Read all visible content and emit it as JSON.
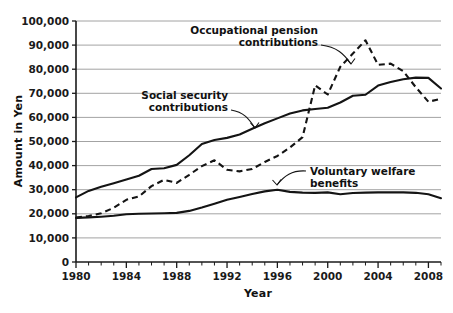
{
  "chart_data": {
    "type": "line",
    "title": "",
    "xlabel": "Year",
    "ylabel": "Amount in Yen",
    "xlim": [
      1980,
      2009
    ],
    "ylim": [
      0,
      100000
    ],
    "grid": true,
    "legend_position": "inline-annotations",
    "x_tick_labels": [
      "1980",
      "1984",
      "1988",
      "1992",
      "1996",
      "2000",
      "2004",
      "2008"
    ],
    "x_tick_values": [
      1980,
      1984,
      1988,
      1992,
      1996,
      2000,
      2004,
      2008
    ],
    "x_minor_tick_step": 1,
    "y_tick_labels": [
      "0",
      "10,000",
      "20,000",
      "30,000",
      "40,000",
      "50,000",
      "60,000",
      "70,000",
      "80,000",
      "90,000",
      "100,000"
    ],
    "y_tick_values": [
      0,
      10000,
      20000,
      30000,
      40000,
      50000,
      60000,
      70000,
      80000,
      90000,
      100000
    ],
    "x": [
      1980,
      1981,
      1982,
      1983,
      1984,
      1985,
      1986,
      1987,
      1988,
      1989,
      1990,
      1991,
      1992,
      1993,
      1994,
      1995,
      1996,
      1997,
      1998,
      1999,
      2000,
      2001,
      2002,
      2003,
      2004,
      2005,
      2006,
      2007,
      2008,
      2009
    ],
    "series": [
      {
        "name": "Social security contributions",
        "style": "solid",
        "color": "#141414",
        "values": [
          26800,
          29500,
          31200,
          32700,
          34200,
          35800,
          38600,
          38900,
          40300,
          44300,
          49000,
          50600,
          51500,
          52900,
          55300,
          57600,
          59600,
          61600,
          62900,
          63500,
          64000,
          66200,
          69000,
          69400,
          73200,
          74700,
          75800,
          76500,
          76400,
          72000
        ]
      },
      {
        "name": "Occupational pension contributions",
        "style": "dashed",
        "color": "#141414",
        "values": [
          18400,
          19100,
          20200,
          22500,
          25800,
          27200,
          31500,
          34100,
          32800,
          36200,
          39800,
          42200,
          38300,
          37600,
          38600,
          41500,
          44000,
          47500,
          51800,
          73300,
          69500,
          81000,
          86500,
          92000,
          81800,
          82300,
          79200,
          72500,
          66500,
          67700
        ]
      },
      {
        "name": "Voluntary welfare benefits",
        "style": "solid",
        "color": "#3a3a3a",
        "values": [
          18300,
          18500,
          18800,
          19200,
          19800,
          20000,
          20100,
          20200,
          20400,
          21200,
          22600,
          24200,
          25800,
          27000,
          28200,
          29300,
          30000,
          29100,
          28800,
          28700,
          28900,
          28100,
          28600,
          28800,
          28900,
          28900,
          28900,
          28700,
          28100,
          26500
        ]
      }
    ],
    "annotations": [
      {
        "id": "occupational-pension-label",
        "lines": [
          "Occupational pension",
          "contributions"
        ],
        "points_to": {
          "x": 2001,
          "y": 81000
        }
      },
      {
        "id": "social-security-label",
        "lines": [
          "Social security",
          "contributions"
        ],
        "points_to": {
          "x": 1994,
          "y": 55300
        }
      },
      {
        "id": "voluntary-welfare-label",
        "lines": [
          "Voluntary welfare",
          "benefits"
        ],
        "points_to": {
          "x": 1996,
          "y": 30000
        }
      }
    ]
  },
  "axes": {
    "x_title": "Year",
    "y_title": "Amount in Yen"
  }
}
